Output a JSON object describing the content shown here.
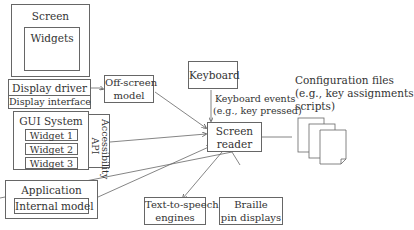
{
  "diagram": {
    "screen": {
      "title": "Screen",
      "widgets_label": "Widgets"
    },
    "display_driver": {
      "title": "Display driver",
      "interface": "Display interface"
    },
    "gui_system": {
      "title": "GUI System",
      "widgets": [
        "Widget 1",
        "Widget 2",
        "Widget 3"
      ],
      "api_label": "Accessibility API"
    },
    "application": {
      "title": "Application",
      "internal": "Internal model"
    },
    "off_screen_model": {
      "line1": "Off-screen",
      "line2": "model"
    },
    "keyboard": {
      "title": "Keyboard",
      "events_line1": "Keyboard events",
      "events_line2": "(e.g., key pressed)"
    },
    "screen_reader": {
      "line1": "Screen",
      "line2": "reader"
    },
    "config_files": {
      "line1": "Configuration files",
      "line2": "(e.g., key assignments",
      "line3": "scripts)"
    },
    "tts": {
      "line1": "Text-to-speech",
      "line2": "engines"
    },
    "braille": {
      "line1": "Braille",
      "line2": "pin displays"
    }
  }
}
